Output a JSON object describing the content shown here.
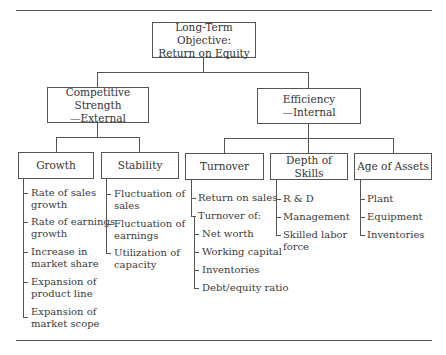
{
  "root": {
    "line1": "Long-Term Objective:",
    "line2": "Return on Equity"
  },
  "level1": [
    {
      "line1": "Competitive Strength",
      "line2": "—External"
    },
    {
      "line1": "Efficiency",
      "line2": "—Internal"
    }
  ],
  "level2": [
    {
      "label": "Growth",
      "items": [
        {
          "lines": [
            "Rate of sales",
            "growth"
          ]
        },
        {
          "lines": [
            "Rate of earnings",
            "growth"
          ]
        },
        {
          "lines": [
            "Increase in",
            "market share"
          ]
        },
        {
          "lines": [
            "Expansion of",
            "product line"
          ]
        },
        {
          "lines": [
            "Expansion of",
            "market scope"
          ]
        }
      ]
    },
    {
      "label": "Stability",
      "items": [
        {
          "lines": [
            "Fluctuation of",
            "sales"
          ]
        },
        {
          "lines": [
            "Fluctuation of",
            "earnings"
          ]
        },
        {
          "lines": [
            "Utilization of",
            "capacity"
          ]
        }
      ]
    },
    {
      "label": "Turnover",
      "items": [
        {
          "lines": [
            "Return on sales"
          ]
        },
        {
          "lines": [
            "Turnover of:"
          ]
        },
        {
          "lines": [
            "Net worth"
          ]
        },
        {
          "lines": [
            "Working capital"
          ]
        },
        {
          "lines": [
            "Inventories"
          ]
        },
        {
          "lines": [
            "Debt/equity ratio"
          ]
        }
      ]
    },
    {
      "label": "Depth of Skills",
      "items": [
        {
          "lines": [
            "R & D"
          ]
        },
        {
          "lines": [
            "Management"
          ]
        },
        {
          "lines": [
            "Skilled labor",
            "force"
          ]
        }
      ]
    },
    {
      "label": "Age of Assets",
      "items": [
        {
          "lines": [
            "Plant"
          ]
        },
        {
          "lines": [
            "Equipment"
          ]
        },
        {
          "lines": [
            "Inventories"
          ]
        }
      ]
    }
  ]
}
